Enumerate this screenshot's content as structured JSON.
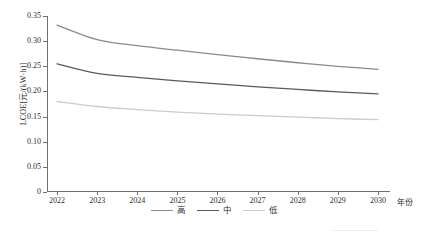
{
  "chart_data": {
    "type": "line",
    "title": "",
    "xlabel": "年份",
    "ylabel": "LCOE[元/(kW·h)]",
    "x": [
      2022,
      2023,
      2024,
      2025,
      2026,
      2027,
      2028,
      2029,
      2030
    ],
    "xlim": [
      2021.75,
      2030.3
    ],
    "ylim": [
      0,
      0.35
    ],
    "yticks": [
      "0",
      "0.05",
      "0.10",
      "0.15",
      "0.20",
      "0.25",
      "0.30",
      "0.35"
    ],
    "ytick_values": [
      0,
      0.05,
      0.1,
      0.15,
      0.2,
      0.25,
      0.3,
      0.35
    ],
    "xticks": [
      "2022",
      "2023",
      "2024",
      "2025",
      "2026",
      "2027",
      "2028",
      "2029",
      "2030"
    ],
    "grid": false,
    "legend_position": "bottom-center",
    "series": [
      {
        "name": "高",
        "color": "#8a8a8a",
        "values": [
          0.332,
          0.303,
          0.291,
          0.282,
          0.273,
          0.265,
          0.257,
          0.25,
          0.244
        ]
      },
      {
        "name": "中",
        "color": "#5a5a5a",
        "values": [
          0.255,
          0.236,
          0.228,
          0.221,
          0.215,
          0.209,
          0.204,
          0.199,
          0.195
        ]
      },
      {
        "name": "低",
        "color": "#cccccc",
        "values": [
          0.18,
          0.17,
          0.164,
          0.159,
          0.155,
          0.152,
          0.149,
          0.146,
          0.144
        ]
      }
    ]
  },
  "axes": {
    "y_title": "LCOE[元/(kW·h)]",
    "x_title": "年份"
  },
  "legend": {
    "items": [
      {
        "label": "高"
      },
      {
        "label": "中"
      },
      {
        "label": "低"
      }
    ]
  },
  "caption_fragment": {
    "text": "·················"
  },
  "colors": {
    "axis": "#6f6f6f",
    "text": "#2e2e2e",
    "series_high": "#8a8a8a",
    "series_mid": "#5a5a5a",
    "series_low": "#cccccc",
    "background": "#ffffff"
  }
}
